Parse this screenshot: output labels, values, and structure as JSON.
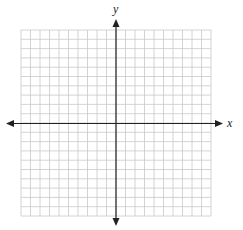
{
  "diagram": {
    "type": "coordinate-plane",
    "x_axis_label": "x",
    "y_axis_label": "y",
    "grid": {
      "cells_x": 20,
      "cells_y": 20,
      "left": 21,
      "top": 30,
      "right": 211,
      "bottom": 216,
      "line_color": "#c9c9c9"
    },
    "axes": {
      "color": "#222222",
      "x_axis_y": 123.5,
      "y_axis_x": 116,
      "x_left_tip": 6,
      "x_right_tip": 223,
      "y_top_tip": 19,
      "y_bottom_tip": 226
    }
  }
}
